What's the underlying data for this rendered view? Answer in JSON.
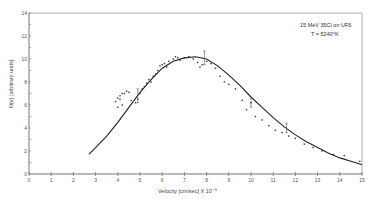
{
  "chart_data": {
    "type": "scatter",
    "title": "",
    "annotation": {
      "line1": "15 MeV 35Cl on UF6",
      "line2": "T = 5240°K"
    },
    "xlabel": "Velocity [cm/sec] X 10⁻⁸",
    "ylabel": "N(v) [arbitrary units]",
    "xlim": [
      0,
      15
    ],
    "ylim": [
      0,
      14
    ],
    "xticks": [
      0,
      1,
      2,
      3,
      4,
      5,
      6,
      7,
      8,
      9,
      10,
      11,
      12,
      13,
      14,
      15
    ],
    "yticks": [
      0,
      2,
      4,
      6,
      8,
      10,
      12,
      14
    ],
    "grid": false,
    "legend": null,
    "series": [
      {
        "name": "measured",
        "kind": "points",
        "x": [
          3.9,
          4.0,
          4.1,
          4.2,
          4.3,
          4.4,
          4.5,
          4.0,
          4.2,
          4.1,
          4.6,
          4.8,
          4.9,
          5.0,
          5.1,
          5.2,
          5.3,
          5.4,
          5.5,
          5.6,
          5.7,
          5.8,
          5.9,
          6.0,
          6.1,
          6.2,
          6.3,
          6.5,
          6.6,
          6.7,
          6.8,
          7.0,
          7.2,
          7.4,
          7.6,
          7.7,
          7.8,
          8.0,
          8.2,
          8.4,
          8.6,
          8.8,
          9.0,
          9.3,
          9.6,
          9.8,
          10.0,
          10.2,
          10.5,
          10.8,
          11.1,
          11.4,
          11.7,
          12.0,
          12.4,
          12.8,
          13.2,
          13.7,
          14.2,
          14.9
        ],
        "y": [
          6.3,
          6.6,
          6.8,
          7.0,
          7.0,
          7.2,
          7.1,
          5.8,
          6.0,
          6.5,
          6.4,
          6.2,
          6.5,
          7.0,
          7.4,
          7.6,
          7.9,
          8.2,
          8.0,
          8.5,
          8.7,
          9.0,
          9.4,
          9.5,
          9.6,
          9.3,
          9.8,
          10.0,
          10.2,
          10.1,
          9.9,
          10.1,
          10.2,
          10.0,
          9.7,
          9.3,
          9.5,
          9.8,
          9.6,
          9.2,
          8.5,
          8.0,
          7.8,
          7.4,
          6.4,
          5.6,
          6.2,
          5.0,
          4.7,
          4.2,
          3.8,
          3.6,
          3.3,
          3.1,
          2.6,
          2.3,
          2.0,
          1.7,
          1.6,
          1.1
        ]
      },
      {
        "name": "Maxwellian fit",
        "kind": "line",
        "x": [
          2.7,
          3.0,
          3.5,
          4.0,
          4.5,
          5.0,
          5.5,
          6.0,
          6.5,
          7.0,
          7.5,
          8.0,
          8.5,
          9.0,
          9.5,
          10.0,
          10.5,
          11.0,
          11.5,
          12.0,
          12.5,
          13.0,
          13.5,
          14.0,
          14.5,
          15.0
        ],
        "y": [
          1.7,
          2.3,
          3.3,
          4.5,
          5.8,
          7.1,
          8.2,
          9.2,
          9.8,
          10.1,
          10.2,
          10.0,
          9.4,
          8.6,
          7.7,
          6.7,
          5.8,
          4.9,
          4.1,
          3.4,
          2.8,
          2.3,
          1.8,
          1.4,
          1.1,
          0.8
        ]
      },
      {
        "name": "error bars",
        "kind": "errorbar",
        "x": [
          4.9,
          7.9,
          10.0,
          11.6
        ],
        "y": [
          6.8,
          10.1,
          6.2,
          4.0
        ],
        "err": [
          0.6,
          0.6,
          0.4,
          0.4
        ]
      }
    ]
  }
}
